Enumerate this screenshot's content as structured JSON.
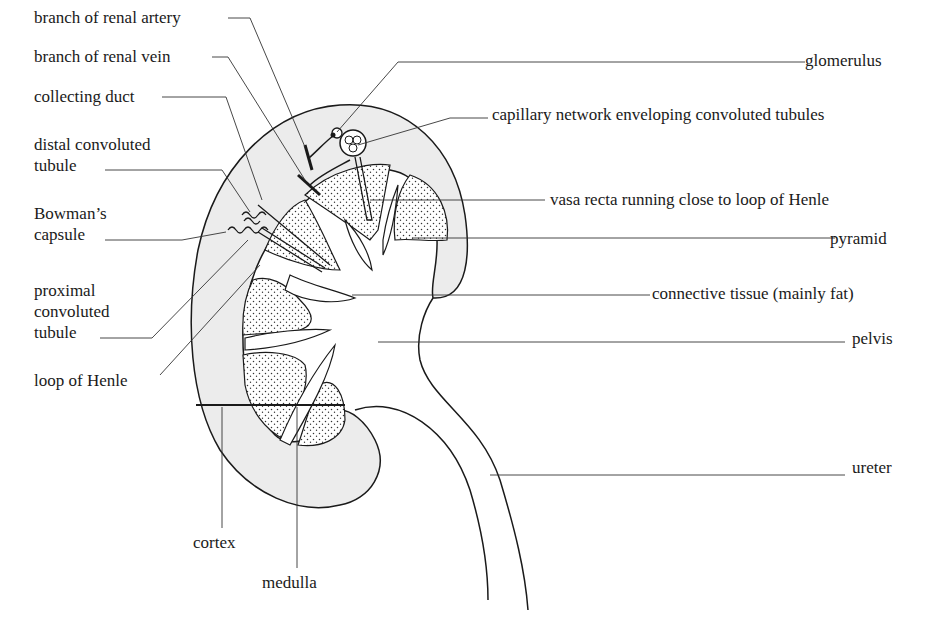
{
  "diagram": {
    "colors": {
      "ink": "#1a1a1a",
      "cortex_fill": "#ececec",
      "pyramid_fill": "#d8d8d8",
      "stipple": "#333333",
      "background": "#ffffff"
    }
  },
  "labels_left": [
    {
      "id": "branch-renal-artery",
      "lines": [
        "branch of renal artery"
      ]
    },
    {
      "id": "branch-renal-vein",
      "lines": [
        "branch of renal vein"
      ]
    },
    {
      "id": "collecting-duct",
      "lines": [
        "collecting duct"
      ]
    },
    {
      "id": "distal-convoluted-tubule",
      "lines": [
        "distal convoluted",
        "tubule"
      ]
    },
    {
      "id": "bowmans-capsule",
      "lines": [
        "Bowman’s",
        "capsule"
      ]
    },
    {
      "id": "proximal-convoluted-tubule",
      "lines": [
        "proximal",
        "convoluted",
        "tubule"
      ]
    },
    {
      "id": "loop-of-henle",
      "lines": [
        "loop of Henle"
      ]
    }
  ],
  "labels_right": [
    {
      "id": "glomerulus",
      "lines": [
        "glomerulus"
      ]
    },
    {
      "id": "capillary-network",
      "lines": [
        "capillary network enveloping convoluted tubules"
      ]
    },
    {
      "id": "vasa-recta",
      "lines": [
        "vasa recta running close to loop of Henle"
      ]
    },
    {
      "id": "pyramid",
      "lines": [
        "pyramid"
      ]
    },
    {
      "id": "connective-tissue",
      "lines": [
        "connective tissue (mainly fat)"
      ]
    },
    {
      "id": "pelvis",
      "lines": [
        "pelvis"
      ]
    },
    {
      "id": "ureter",
      "lines": [
        "ureter"
      ]
    }
  ],
  "labels_bottom": [
    {
      "id": "cortex",
      "lines": [
        "cortex"
      ]
    },
    {
      "id": "medulla",
      "lines": [
        "medulla"
      ]
    }
  ]
}
